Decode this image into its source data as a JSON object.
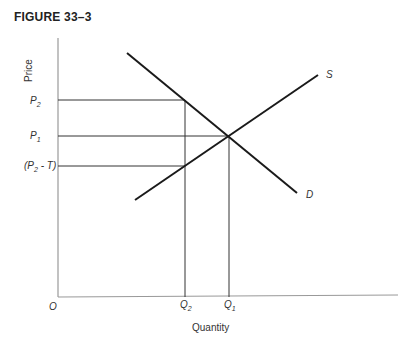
{
  "figure": {
    "title": "FIGURE 33–3"
  },
  "axes": {
    "ylabel": "Price",
    "xlabel": "Quantity",
    "origin_label": "O"
  },
  "price_labels": {
    "p2": "P",
    "p2_sub": "2",
    "p1": "P",
    "p1_sub": "1",
    "p2t_open": "(P",
    "p2t_sub": "2",
    "p2t_close": " - T)"
  },
  "quantity_labels": {
    "q2": "Q",
    "q2_sub": "2",
    "q1": "Q",
    "q1_sub": "1"
  },
  "curves": {
    "supply_label": "S",
    "demand_label": "D"
  },
  "colors": {
    "curve": "#1a1a1a",
    "guide": "#333333",
    "axis": "#888888"
  }
}
